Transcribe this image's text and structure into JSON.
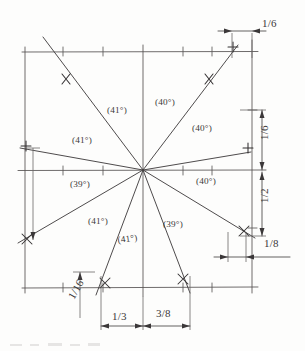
{
  "drawing": {
    "title": "Hand-drawn angular division sketch",
    "medium_note": "pencil on paper, scanned",
    "ink_color": "#3b3839",
    "paper_color": "#fdfdfc",
    "center_point": {
      "x": 143,
      "y": 170
    }
  },
  "angle_labels": [
    {
      "id": "upper-left-outer",
      "text": "(41°)",
      "x": 72,
      "y": 143,
      "angle_value": 41
    },
    {
      "id": "upper-left-inner",
      "text": "(41°)",
      "x": 107,
      "y": 113,
      "angle_value": 41
    },
    {
      "id": "upper-right-inner",
      "text": "(40°)",
      "x": 155,
      "y": 105,
      "angle_value": 40
    },
    {
      "id": "upper-right-outer",
      "text": "(40°)",
      "x": 192,
      "y": 131,
      "angle_value": 40
    },
    {
      "id": "lower-left-outer",
      "text": "(39°)",
      "x": 70,
      "y": 187,
      "angle_value": 39
    },
    {
      "id": "lower-left-mid",
      "text": "(41°)",
      "x": 88,
      "y": 224,
      "angle_value": 41
    },
    {
      "id": "lower-left-inner",
      "text": "(41°)",
      "x": 122,
      "y": 243,
      "angle_value": 41
    },
    {
      "id": "lower-right-inner",
      "text": "(39°)",
      "x": 163,
      "y": 227,
      "angle_value": 39
    },
    {
      "id": "lower-right-outer",
      "text": "(40°)",
      "x": 196,
      "y": 184,
      "angle_value": 40
    }
  ],
  "dimension_labels": [
    {
      "id": "top-right",
      "text": "1/6",
      "x": 262,
      "y": 27,
      "rotated": false
    },
    {
      "id": "right-upper",
      "text": "1/6",
      "x": 268,
      "y": 140,
      "rotated": true
    },
    {
      "id": "right-lower",
      "text": "1/2",
      "x": 268,
      "y": 203,
      "rotated": true
    },
    {
      "id": "right-bottom",
      "text": "1/8",
      "x": 272,
      "y": 247,
      "rotated": false
    },
    {
      "id": "bottom-left",
      "text": "1/16",
      "x": 74,
      "y": 300,
      "rotated": true
    },
    {
      "id": "bottom-mid",
      "text": "1/3",
      "x": 124,
      "y": 320,
      "rotated": false
    },
    {
      "id": "bottom-right",
      "text": "3/8",
      "x": 167,
      "y": 317,
      "rotated": false
    }
  ]
}
